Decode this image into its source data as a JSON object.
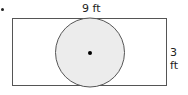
{
  "figure": {
    "shape_outer": "rectangle",
    "shape_inner": "circle",
    "labels": {
      "top": "9 ft",
      "right": "3 ft"
    },
    "colors": {
      "stroke": "#555555",
      "circle_fill": "#ececec",
      "center_dot": "#000000"
    }
  }
}
